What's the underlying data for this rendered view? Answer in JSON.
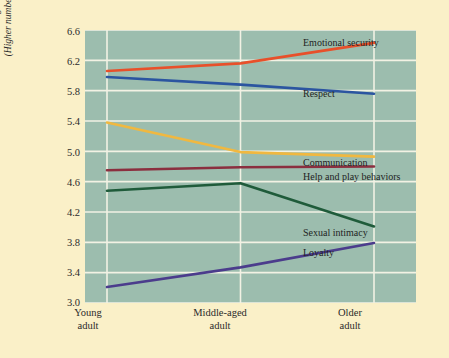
{
  "figure": {
    "background_color": "#FAF0C8",
    "plot_background_color": "#9CBDAE",
    "gridline_color": "#F2F2E4"
  },
  "axes": {
    "ylabel_line1": "Average rating of importance",
    "ylabel_line2": "(Higher numbers mean more important)",
    "yticks": [
      "6.6",
      "6.2",
      "5.8",
      "5.4",
      "5.0",
      "4.6",
      "4.2",
      "3.8",
      "3.4",
      "3.0"
    ],
    "xticks": [
      {
        "line1": "Young",
        "line2": "adult"
      },
      {
        "line1": "Middle-aged",
        "line2": "adult"
      },
      {
        "line1": "Older",
        "line2": "adult"
      }
    ]
  },
  "series_labels": {
    "emotional_security": "Emotional security",
    "respect": "Respect",
    "communication": "Communication",
    "help_and_play": "Help and play behaviors",
    "sexual_intimacy": "Sexual intimacy",
    "loyalty": "Loyalty"
  },
  "chart_data": {
    "type": "line",
    "title": "",
    "xlabel": "",
    "ylabel": "Average rating of importance (Higher numbers mean more important)",
    "categories": [
      "Young adult",
      "Middle-aged adult",
      "Older adult"
    ],
    "ylim": [
      3.0,
      6.6
    ],
    "ytick_step": 0.4,
    "grid": true,
    "legend_position": "inline-right-of-line-ends",
    "series": [
      {
        "name": "Emotional security",
        "color": "#E8502A",
        "values": [
          6.06,
          6.16,
          6.43
        ]
      },
      {
        "name": "Respect",
        "color": "#2B55A0",
        "values": [
          5.98,
          5.88,
          5.76
        ]
      },
      {
        "name": "Communication",
        "color": "#F0B840",
        "values": [
          5.38,
          4.99,
          4.93
        ]
      },
      {
        "name": "Help and play behaviors",
        "color": "#8B2F3F",
        "values": [
          4.75,
          4.79,
          4.8
        ]
      },
      {
        "name": "Sexual intimacy",
        "color": "#1F5B3A",
        "values": [
          4.48,
          4.58,
          4.01
        ]
      },
      {
        "name": "Loyalty",
        "color": "#4B3C8C",
        "values": [
          3.21,
          3.47,
          3.79
        ]
      }
    ]
  }
}
